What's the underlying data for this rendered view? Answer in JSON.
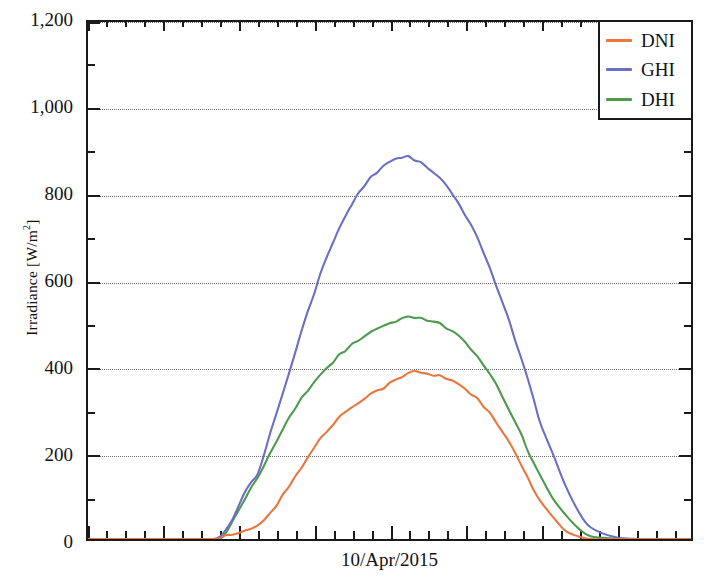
{
  "chart_data": {
    "type": "line",
    "title": "",
    "subtitle": "",
    "xlabel": "10/Apr/2015",
    "ylabel": "Irradiance [W/m²]",
    "ylabel_text": "Irradiance [W/m",
    "ylabel_sup": "2",
    "ylabel_tail": "]",
    "ylim": [
      0,
      1200
    ],
    "ytick_labels": [
      "1,200",
      "1,000",
      "800",
      "600",
      "400",
      "200",
      "0"
    ],
    "ytick_values": [
      1200,
      1000,
      800,
      600,
      400,
      200,
      0
    ],
    "yminor_step": 100,
    "grid": "horizontal-dotted",
    "grid_values": [
      1200,
      1000,
      800,
      600,
      400,
      200
    ],
    "xlim_hours": [
      0,
      24
    ],
    "xtick_major_hours": [
      0,
      3,
      6,
      9,
      12,
      15,
      18,
      21,
      24
    ],
    "xtick_minor_step_hours": 0.75,
    "xtick_labels": [],
    "legend_position": "top-right",
    "legend": [
      "DNI",
      "GHI",
      "DHI"
    ],
    "colors": {
      "DNI": "#e8763f",
      "GHI": "#6b6fc4",
      "DHI": "#4d9a4d"
    },
    "axis_color": "#1a1a1a",
    "grid_color": "#6d6d6d",
    "background": "#ffffff",
    "x": [
      0,
      0.5,
      1,
      1.5,
      2,
      2.5,
      3,
      3.5,
      4,
      4.5,
      5,
      5.25,
      5.5,
      5.75,
      6,
      6.25,
      6.5,
      6.75,
      7,
      7.25,
      7.5,
      7.75,
      8,
      8.25,
      8.5,
      8.75,
      9,
      9.25,
      9.5,
      9.75,
      10,
      10.25,
      10.5,
      10.75,
      11,
      11.25,
      11.5,
      11.75,
      12,
      12.25,
      12.5,
      12.75,
      13,
      13.25,
      13.5,
      13.75,
      14,
      14.25,
      14.5,
      14.75,
      15,
      15.25,
      15.5,
      15.75,
      16,
      16.25,
      16.5,
      16.75,
      17,
      17.25,
      17.5,
      17.75,
      18,
      18.5,
      19,
      19.5,
      20,
      21,
      22,
      23,
      24
    ],
    "series": [
      {
        "name": "DNI",
        "color": "#e8763f",
        "unit": "W/m²",
        "peak_value": 390,
        "peak_hour": 12.6,
        "values": [
          0,
          0,
          0,
          0,
          0,
          0,
          0,
          0,
          0,
          0,
          0,
          2,
          6,
          10,
          14,
          18,
          22,
          30,
          45,
          62,
          80,
          100,
          122,
          145,
          168,
          190,
          212,
          232,
          250,
          266,
          282,
          296,
          308,
          318,
          328,
          336,
          344,
          352,
          360,
          368,
          376,
          384,
          390,
          386,
          382,
          380,
          378,
          374,
          368,
          360,
          350,
          338,
          324,
          308,
          290,
          270,
          248,
          224,
          198,
          170,
          142,
          114,
          86,
          48,
          20,
          6,
          0,
          0,
          0,
          0,
          0
        ]
      },
      {
        "name": "GHI",
        "color": "#6b6fc4",
        "unit": "W/m²",
        "peak_value": 888,
        "peak_hour": 12.3,
        "values": [
          0,
          0,
          0,
          0,
          0,
          0,
          0,
          0,
          0,
          0,
          0,
          6,
          22,
          48,
          78,
          110,
          130,
          152,
          196,
          244,
          292,
          340,
          388,
          436,
          482,
          528,
          572,
          614,
          652,
          688,
          720,
          750,
          776,
          800,
          820,
          838,
          852,
          866,
          876,
          884,
          888,
          886,
          880,
          872,
          862,
          850,
          836,
          820,
          800,
          778,
          754,
          726,
          696,
          664,
          628,
          590,
          550,
          508,
          464,
          418,
          370,
          320,
          270,
          196,
          124,
          64,
          24,
          4,
          0,
          0,
          0
        ]
      },
      {
        "name": "DHI",
        "color": "#4d9a4d",
        "unit": "W/m²",
        "peak_value": 514,
        "peak_hour": 12.6,
        "values": [
          0,
          0,
          0,
          0,
          0,
          0,
          0,
          0,
          0,
          0,
          0,
          5,
          18,
          40,
          66,
          96,
          118,
          140,
          170,
          198,
          226,
          254,
          280,
          304,
          326,
          346,
          364,
          382,
          398,
          412,
          426,
          438,
          450,
          460,
          470,
          478,
          486,
          494,
          500,
          506,
          510,
          513,
          514,
          513,
          510,
          506,
          500,
          492,
          482,
          470,
          456,
          440,
          422,
          402,
          380,
          356,
          330,
          302,
          272,
          240,
          208,
          176,
          144,
          96,
          56,
          26,
          8,
          1,
          0,
          0,
          0
        ]
      }
    ]
  }
}
